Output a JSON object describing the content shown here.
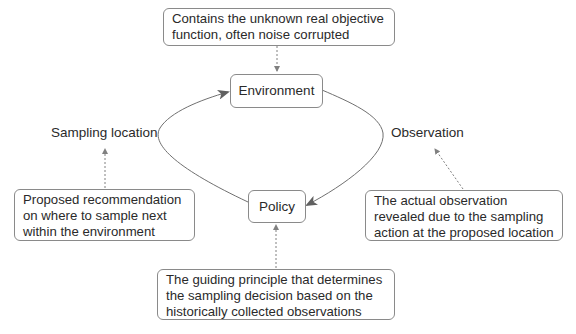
{
  "diagram": {
    "nodes": {
      "environment": {
        "label": "Environment"
      },
      "policy": {
        "label": "Policy"
      }
    },
    "edge_labels": {
      "sampling_location": "Sampling location",
      "observation": "Observation"
    },
    "notes": {
      "environment_note": {
        "lines": [
          "Contains the unknown real objective",
          "function, often noise corrupted"
        ]
      },
      "sampling_note": {
        "lines": [
          "Proposed recommendation",
          "on where to sample next",
          "within the environment"
        ]
      },
      "observation_note": {
        "lines": [
          "The actual observation",
          "revealed due to the sampling",
          "action at the proposed location"
        ]
      },
      "policy_note": {
        "lines": [
          "The guiding principle that determines",
          "the sampling decision based on the",
          "historically collected observations"
        ]
      }
    },
    "colors": {
      "edge": "#707070",
      "border": "#8a8a8a",
      "text": "#2a2a2a",
      "dashed": "#808080"
    }
  }
}
